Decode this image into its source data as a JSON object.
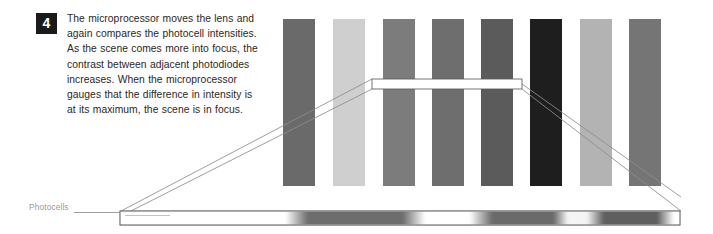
{
  "page": {
    "width": 713,
    "height": 234,
    "background": "#ffffff",
    "kind": "instructional-diagram"
  },
  "caption": {
    "step_number": "4",
    "badge_bg": "#1a1a1a",
    "badge_fg": "#ffffff",
    "text_color": "#2b2724",
    "lines": [
      "The microprocessor moves the lens and",
      "again compares the photocell intensities.",
      "As the scene comes more into focus, the",
      "contrast between adjacent photodiodes",
      "increases. When the microprocessor",
      "gauges that the difference in intensity is",
      "at its maximum, the scene is in focus."
    ],
    "full_text": "The microprocessor moves the lens and again compares the photocell intensities. As the scene comes more into focus, the contrast between adjacent photodiodes increases. When the microprocessor gauges that the difference in intensity is at its maximum, the scene is in focus."
  },
  "labels": {
    "photocells": "Photocells",
    "photocells_color": "#9a9a9a"
  },
  "chart_data": {
    "type": "bar",
    "xlabel": "",
    "ylabel": "",
    "categories": [
      "1",
      "2",
      "3",
      "4",
      "5",
      "6",
      "7",
      "8"
    ],
    "values": [
      58,
      82,
      60,
      55,
      48,
      18,
      78,
      56
    ],
    "value_unit": "relative brightness (0=black, 100=white)",
    "colors": [
      "#6a6a6a",
      "#cfcfcf",
      "#7c7c7c",
      "#6e6e6e",
      "#5b5b5b",
      "#1e1e1e",
      "#b3b3b3",
      "#757575"
    ],
    "bar_x": [
      283,
      333,
      383,
      432,
      481,
      530,
      580,
      629
    ],
    "bar_width": 32,
    "bar_top": 19,
    "bar_bottom": 186,
    "grid": false,
    "legend": null,
    "ylim": [
      0,
      100
    ]
  },
  "callout": {
    "name": "sensor-detail-callout",
    "stroke": "#5b5b5b",
    "fill": "#ffffff",
    "x": 372,
    "y": 79,
    "width": 150,
    "height": 10
  },
  "photocell_strip": {
    "name": "photocell-array-strip",
    "x": 120,
    "y": 211,
    "width": 560,
    "height": 14,
    "stroke": "#6f6f6f",
    "fill": "#ffffff",
    "band_description": "blurred alternating dark and light bands along the sensor strip",
    "bands": [
      {
        "start_pct": 0.0,
        "end_pct": 30.0,
        "shade": "#ffffff"
      },
      {
        "start_pct": 33.0,
        "end_pct": 52.0,
        "shade": "#6d6d6d"
      },
      {
        "start_pct": 55.0,
        "end_pct": 63.0,
        "shade": "#ffffff"
      },
      {
        "start_pct": 66.0,
        "end_pct": 78.0,
        "shade": "#6a6a6a"
      },
      {
        "start_pct": 80.0,
        "end_pct": 84.0,
        "shade": "#f2f2f2"
      },
      {
        "start_pct": 86.0,
        "end_pct": 97.0,
        "shade": "#5f5f5f"
      },
      {
        "start_pct": 99.0,
        "end_pct": 100.0,
        "shade": "#ffffff"
      }
    ]
  },
  "leader_lines": {
    "stroke": "#8a8a8a",
    "label_rule": {
      "x1": 74,
      "y1": 212,
      "x2": 120,
      "y2": 212
    },
    "left_perspective": {
      "x1": 372,
      "y1": 79,
      "x2": 120,
      "y2": 211
    },
    "left_perspective_lower": {
      "x1": 372,
      "y1": 89,
      "x2": 120,
      "y2": 217
    },
    "right_perspective": {
      "x1": 522,
      "y1": 84,
      "x2": 680,
      "y2": 211
    },
    "right_perspective_lower": {
      "x1": 522,
      "y1": 89,
      "x2": 680,
      "y2": 200
    }
  }
}
